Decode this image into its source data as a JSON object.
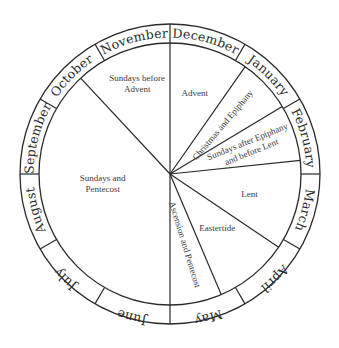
{
  "diagram": {
    "type": "liturgical-year-wheel",
    "center": [
      170,
      174
    ],
    "outer_radius": 150,
    "inner_radius": 131,
    "stroke_color": "#2a2a2a",
    "text_color": "#2a2a2a",
    "background": "#ffffff"
  },
  "months": [
    {
      "label": "December",
      "start_deg": 0,
      "end_deg": 30
    },
    {
      "label": "January",
      "start_deg": 30,
      "end_deg": 60
    },
    {
      "label": "February",
      "start_deg": 60,
      "end_deg": 90
    },
    {
      "label": "March",
      "start_deg": 90,
      "end_deg": 120
    },
    {
      "label": "April",
      "start_deg": 120,
      "end_deg": 150
    },
    {
      "label": "May",
      "start_deg": 150,
      "end_deg": 180
    },
    {
      "label": "June",
      "start_deg": 180,
      "end_deg": 210
    },
    {
      "label": "July",
      "start_deg": 210,
      "end_deg": 240
    },
    {
      "label": "August",
      "start_deg": 240,
      "end_deg": 270
    },
    {
      "label": "September",
      "start_deg": 270,
      "end_deg": 300
    },
    {
      "label": "October",
      "start_deg": 300,
      "end_deg": 330
    },
    {
      "label": "November",
      "start_deg": 330,
      "end_deg": 360
    }
  ],
  "seasons": [
    {
      "label": "Advent",
      "lines": [
        "Advent"
      ],
      "start_deg": 0,
      "end_deg": 35
    },
    {
      "label": "Christmas and Epiphany",
      "lines": [
        "Christmas and Epiphany"
      ],
      "start_deg": 35,
      "end_deg": 59
    },
    {
      "label": "Sundays after Epiphany and before Lent",
      "lines": [
        "Sundays after Epiphany",
        "and before Lent"
      ],
      "start_deg": 59,
      "end_deg": 84
    },
    {
      "label": "Lent",
      "lines": [
        "Lent"
      ],
      "start_deg": 84,
      "end_deg": 124
    },
    {
      "label": "Eastertide",
      "lines": [
        "Eastertide"
      ],
      "start_deg": 124,
      "end_deg": 157
    },
    {
      "label": "Ascension and Pentecost",
      "lines": [
        "Ascension and Pentecost"
      ],
      "start_deg": 157,
      "end_deg": 180
    },
    {
      "label": "Sundays and Pentecost",
      "lines": [
        "Sundays and",
        "Pentecost"
      ],
      "start_deg": 180,
      "end_deg": 317
    },
    {
      "label": "Sundays before Advent",
      "lines": [
        "Sundays before",
        "Advent"
      ],
      "start_deg": 317,
      "end_deg": 360
    }
  ],
  "spokes_deg": [
    0,
    35,
    59,
    84,
    124,
    157,
    180,
    317
  ]
}
